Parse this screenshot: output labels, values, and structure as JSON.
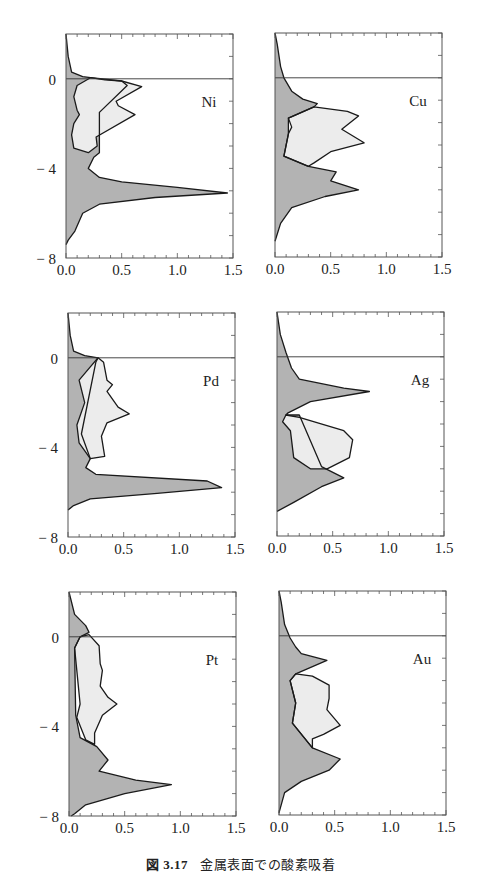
{
  "figure": {
    "caption_number": "図 3.17",
    "caption_text": "金属表面での酸素吸着"
  },
  "colors": {
    "dark_fill": "#b3b3b3",
    "light_fill": "#ececec",
    "line": "#1a1a1a",
    "frame": "#555555"
  },
  "chart_data": [
    {
      "type": "area",
      "label": "Ni",
      "xlim": [
        0,
        1.5
      ],
      "ylim": [
        -8,
        2
      ],
      "xticks": [
        "0.0",
        "0.5",
        "1.0",
        "1.5"
      ],
      "yticks": [
        "0",
        "-4",
        "-8"
      ],
      "zero_line": 0,
      "panel": {
        "x": 66,
        "y": 34,
        "w": 167,
        "h": 224
      },
      "dark_curve": [
        [
          0,
          2
        ],
        [
          0.02,
          1
        ],
        [
          0.05,
          0.3
        ],
        [
          0.15,
          0.1
        ],
        [
          0.22,
          0.05
        ],
        [
          0.35,
          -0.05
        ],
        [
          0.5,
          -0.1
        ],
        [
          0.55,
          -0.3
        ],
        [
          0.3,
          -1.5
        ],
        [
          0.3,
          -3.3
        ],
        [
          0.25,
          -3.5
        ],
        [
          0.2,
          -4
        ],
        [
          0.3,
          -4.4
        ],
        [
          0.5,
          -4.6
        ],
        [
          1.0,
          -4.85
        ],
        [
          1.45,
          -5.1
        ],
        [
          0.8,
          -5.3
        ],
        [
          0.3,
          -5.6
        ],
        [
          0.15,
          -6
        ],
        [
          0.08,
          -6.8
        ],
        [
          0.02,
          -7.2
        ],
        [
          0,
          -7.4
        ]
      ],
      "light_curve": [
        [
          0.22,
          0.05
        ],
        [
          0.1,
          -0.3
        ],
        [
          0.07,
          -0.8
        ],
        [
          0.1,
          -1.4
        ],
        [
          0.12,
          -1.6
        ],
        [
          0.07,
          -2
        ],
        [
          0.05,
          -2.5
        ],
        [
          0.07,
          -3.1
        ],
        [
          0.2,
          -3.3
        ],
        [
          0.28,
          -3
        ],
        [
          0.27,
          -2.6
        ],
        [
          0.62,
          -1.6
        ],
        [
          0.47,
          -1.2
        ],
        [
          0.45,
          -1
        ],
        [
          0.68,
          -0.35
        ],
        [
          0.5,
          -0.1
        ]
      ]
    },
    {
      "type": "area",
      "label": "Cu",
      "xlim": [
        0,
        1.5
      ],
      "ylim": [
        -8,
        2
      ],
      "xticks": [
        "0.0",
        "0.5",
        "1.0",
        "1.5"
      ],
      "yticks": [],
      "zero_line": 0,
      "panel": {
        "x": 275,
        "y": 33,
        "w": 167,
        "h": 224
      },
      "dark_curve": [
        [
          0,
          2
        ],
        [
          0.02,
          1.5
        ],
        [
          0.05,
          0.5
        ],
        [
          0.08,
          0
        ],
        [
          0.15,
          -0.6
        ],
        [
          0.25,
          -0.95
        ],
        [
          0.38,
          -1.15
        ],
        [
          0.35,
          -1.3
        ],
        [
          0.12,
          -1.8
        ],
        [
          0.12,
          -2.5
        ],
        [
          0.08,
          -3.5
        ],
        [
          0.3,
          -3.95
        ],
        [
          0.55,
          -4.2
        ],
        [
          0.5,
          -4.6
        ],
        [
          0.75,
          -5
        ],
        [
          0.45,
          -5.3
        ],
        [
          0.15,
          -5.8
        ],
        [
          0.05,
          -6.5
        ],
        [
          0,
          -7.3
        ]
      ],
      "light_curve": [
        [
          0.35,
          -1.3
        ],
        [
          0.65,
          -1.5
        ],
        [
          0.75,
          -1.7
        ],
        [
          0.6,
          -2.3
        ],
        [
          0.8,
          -2.9
        ],
        [
          0.5,
          -3.3
        ],
        [
          0.35,
          -3.8
        ],
        [
          0.3,
          -3.95
        ],
        [
          0.08,
          -3.5
        ],
        [
          0.12,
          -2.5
        ],
        [
          0.15,
          -2.2
        ],
        [
          0.12,
          -1.8
        ]
      ]
    },
    {
      "type": "area",
      "label": "Pd",
      "xlim": [
        0,
        1.5
      ],
      "ylim": [
        -8,
        2
      ],
      "xticks": [
        "0.0",
        "0.5",
        "1.0",
        "1.5"
      ],
      "yticks": [
        "0",
        "-4",
        "-8"
      ],
      "zero_line": 0,
      "panel": {
        "x": 68,
        "y": 313,
        "w": 167,
        "h": 224
      },
      "dark_curve": [
        [
          0,
          2
        ],
        [
          0.02,
          1
        ],
        [
          0.05,
          0.3
        ],
        [
          0.15,
          0.1
        ],
        [
          0.27,
          0
        ],
        [
          0.25,
          -0.2
        ],
        [
          0.12,
          -3.4
        ],
        [
          0.2,
          -4.5
        ],
        [
          0.16,
          -4.9
        ],
        [
          0.25,
          -5.2
        ],
        [
          1.25,
          -5.5
        ],
        [
          1.38,
          -5.8
        ],
        [
          0.8,
          -6.05
        ],
        [
          0.2,
          -6.3
        ],
        [
          0.05,
          -6.6
        ],
        [
          0,
          -6.8
        ]
      ],
      "light_curve": [
        [
          0.27,
          0
        ],
        [
          0.32,
          -0.2
        ],
        [
          0.35,
          -1
        ],
        [
          0.4,
          -1.2
        ],
        [
          0.35,
          -1.5
        ],
        [
          0.45,
          -2.2
        ],
        [
          0.55,
          -2.5
        ],
        [
          0.35,
          -2.9
        ],
        [
          0.3,
          -3.5
        ],
        [
          0.33,
          -4.4
        ],
        [
          0.2,
          -4.5
        ],
        [
          0.1,
          -3.8
        ],
        [
          0.08,
          -3
        ],
        [
          0.15,
          -2
        ],
        [
          0.1,
          -1
        ],
        [
          0.2,
          -0.4
        ]
      ]
    },
    {
      "type": "area",
      "label": "Ag",
      "xlim": [
        0,
        1.5
      ],
      "ylim": [
        -8,
        2
      ],
      "xticks": [
        "0.0",
        "0.5",
        "1.0",
        "1.5"
      ],
      "yticks": [],
      "zero_line": 0,
      "panel": {
        "x": 277,
        "y": 312,
        "w": 167,
        "h": 224
      },
      "dark_curve": [
        [
          0,
          2
        ],
        [
          0.03,
          1
        ],
        [
          0.08,
          0.2
        ],
        [
          0.13,
          -0.5
        ],
        [
          0.2,
          -1
        ],
        [
          0.6,
          -1.4
        ],
        [
          0.83,
          -1.55
        ],
        [
          0.3,
          -2
        ],
        [
          0.1,
          -2.5
        ],
        [
          0.08,
          -2.6
        ],
        [
          0.2,
          -2.6
        ],
        [
          0.4,
          -4.9
        ],
        [
          0.6,
          -5.4
        ],
        [
          0.4,
          -5.8
        ],
        [
          0.15,
          -6.5
        ],
        [
          0,
          -6.9
        ]
      ],
      "light_curve": [
        [
          0.08,
          -2.6
        ],
        [
          0.2,
          -2.7
        ],
        [
          0.6,
          -3.3
        ],
        [
          0.68,
          -3.7
        ],
        [
          0.65,
          -4.5
        ],
        [
          0.45,
          -5
        ],
        [
          0.3,
          -5
        ],
        [
          0.15,
          -4.5
        ],
        [
          0.12,
          -3.3
        ],
        [
          0.05,
          -2.9
        ]
      ]
    },
    {
      "type": "area",
      "label": "Pt",
      "xlim": [
        0,
        1.5
      ],
      "ylim": [
        -8,
        2
      ],
      "xticks": [
        "0.0",
        "0.5",
        "1.0",
        "1.5"
      ],
      "yticks": [
        "0",
        "-4",
        "-8"
      ],
      "zero_line": 0,
      "panel": {
        "x": 69,
        "y": 592,
        "w": 167,
        "h": 224
      },
      "dark_curve": [
        [
          0,
          2
        ],
        [
          0.05,
          1
        ],
        [
          0.15,
          0.5
        ],
        [
          0.18,
          0.2
        ],
        [
          0.1,
          0
        ],
        [
          0.05,
          -0.5
        ],
        [
          0.06,
          -3.5
        ],
        [
          0.1,
          -4.5
        ],
        [
          0.25,
          -4.9
        ],
        [
          0.35,
          -5.5
        ],
        [
          0.27,
          -6
        ],
        [
          0.6,
          -6.4
        ],
        [
          0.92,
          -6.6
        ],
        [
          0.5,
          -7
        ],
        [
          0.15,
          -7.5
        ],
        [
          0.05,
          -7.9
        ],
        [
          0.02,
          -8
        ]
      ],
      "light_curve": [
        [
          0.1,
          0
        ],
        [
          0.18,
          0.1
        ],
        [
          0.27,
          -0.4
        ],
        [
          0.28,
          -1.2
        ],
        [
          0.3,
          -1.5
        ],
        [
          0.28,
          -2.2
        ],
        [
          0.35,
          -2.7
        ],
        [
          0.43,
          -3
        ],
        [
          0.3,
          -3.5
        ],
        [
          0.23,
          -4.3
        ],
        [
          0.23,
          -4.8
        ],
        [
          0.15,
          -4.6
        ],
        [
          0.07,
          -3.6
        ],
        [
          0.1,
          -3
        ],
        [
          0.08,
          -2
        ],
        [
          0.05,
          -0.5
        ]
      ]
    },
    {
      "type": "area",
      "label": "Au",
      "xlim": [
        0,
        1.5
      ],
      "ylim": [
        -8,
        2
      ],
      "xticks": [
        "0.0",
        "0.5",
        "1.0",
        "1.5"
      ],
      "yticks": [],
      "zero_line": 0,
      "panel": {
        "x": 279,
        "y": 591,
        "w": 167,
        "h": 224
      },
      "dark_curve": [
        [
          0,
          2
        ],
        [
          0.02,
          1.5
        ],
        [
          0.05,
          0.5
        ],
        [
          0.1,
          -0.1
        ],
        [
          0.15,
          -0.5
        ],
        [
          0.2,
          -0.8
        ],
        [
          0.43,
          -1.1
        ],
        [
          0.15,
          -1.7
        ],
        [
          0.1,
          -2
        ],
        [
          0.15,
          -3
        ],
        [
          0.12,
          -3.9
        ],
        [
          0.3,
          -5
        ],
        [
          0.55,
          -5.5
        ],
        [
          0.45,
          -6
        ],
        [
          0.2,
          -6.5
        ],
        [
          0.05,
          -7
        ],
        [
          0,
          -7.9
        ]
      ],
      "light_curve": [
        [
          0.15,
          -1.7
        ],
        [
          0.3,
          -1.8
        ],
        [
          0.45,
          -2.2
        ],
        [
          0.45,
          -2.8
        ],
        [
          0.43,
          -3.3
        ],
        [
          0.55,
          -4
        ],
        [
          0.4,
          -4.4
        ],
        [
          0.3,
          -4.6
        ],
        [
          0.3,
          -5
        ],
        [
          0.12,
          -3.9
        ],
        [
          0.15,
          -3
        ],
        [
          0.1,
          -2
        ]
      ]
    }
  ]
}
